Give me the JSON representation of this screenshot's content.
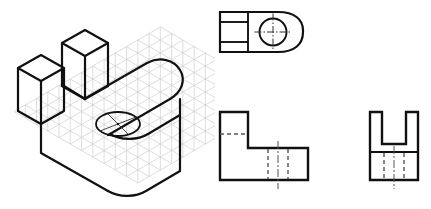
{
  "drawing": {
    "title": "Isometric and Orthographic Projection of L-Bracket with Slot and Hole",
    "sheet_background": "#ffffff",
    "line_color": "#111111",
    "grid_color": "#cfcfcf",
    "hidden_line_color": "#555555",
    "center_line_color": "#555555",
    "visible_line_width": 2.2,
    "hidden_line_width": 1.3,
    "center_line_width": 1.0,
    "hidden_dash_pattern": "4,3",
    "center_dash_pattern": "7,2,1.5,2"
  },
  "views": {
    "isometric": {
      "name": "isometric-pictorial-view",
      "label": "Isometric view",
      "grid": {
        "type": "isometric-dot-grid",
        "visible": true,
        "color": "#cfcfcf",
        "spacing": 13,
        "columns": 13,
        "rows": 11
      },
      "features": [
        "rectangular base plate",
        "rounded right end",
        "through hole in base",
        "two upright prongs forming slot",
        "open U slot between prongs"
      ],
      "hole": {
        "name": "through-hole",
        "shape": "ellipse",
        "center_mark": true,
        "cx": 118,
        "cy": 124,
        "rx": 22,
        "ry": 12
      }
    },
    "top": {
      "name": "top-view",
      "label": "Top view",
      "outline": "rectangle with rounded right end",
      "dividers": {
        "vertical_count": 1,
        "horizontal_count": 2,
        "description": "slot walls projected as three stacked cells on left"
      },
      "hole": {
        "name": "hole-circle",
        "shape": "circle",
        "radius": 14,
        "center_mark": true,
        "center_mark_overhang": 5
      }
    },
    "front": {
      "name": "front-view",
      "label": "Front view",
      "outline": "L-shaped profile",
      "hidden_lines": {
        "horizontal_count": 1,
        "vertical_count": 2,
        "description": "hidden hole walls and slot floor"
      },
      "center_line": {
        "present": true,
        "orientation": "vertical",
        "description": "hole axis centerline extends above and below outline"
      }
    },
    "side": {
      "name": "side-view",
      "label": "Right side view",
      "outline": "U-shaped profile with slot",
      "divider": {
        "horizontal_count": 1,
        "description": "base plate top surface line"
      },
      "hidden_lines": {
        "vertical_count": 2,
        "description": "hidden hole walls in base"
      },
      "center_line": {
        "present": true,
        "orientation": "vertical",
        "description": "hole axis centerline"
      }
    }
  }
}
